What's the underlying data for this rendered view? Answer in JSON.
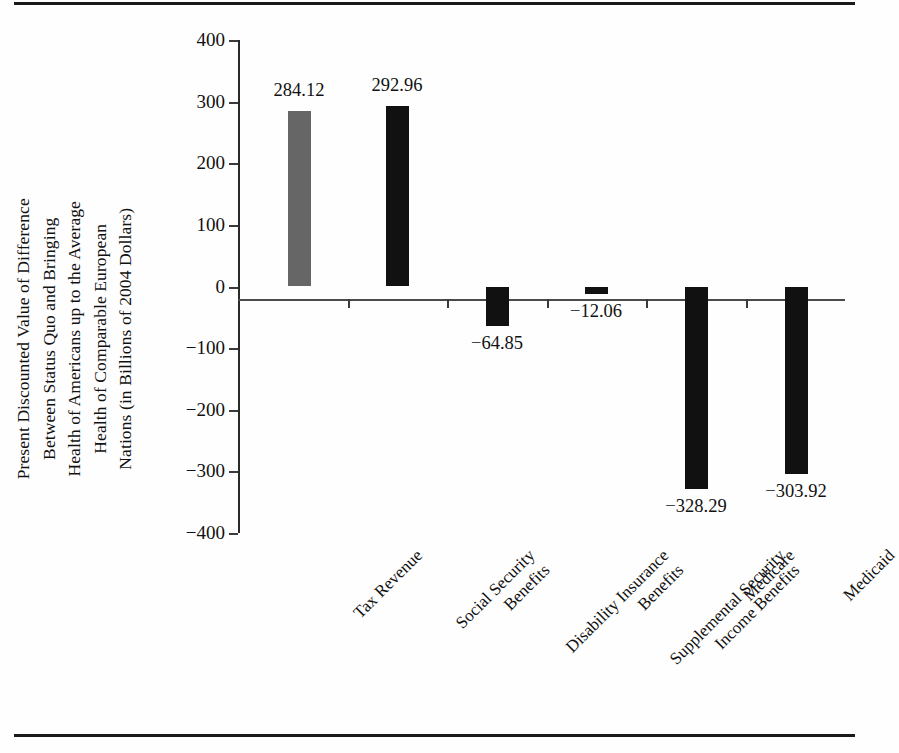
{
  "figure": {
    "has_top_rule": true,
    "has_bottom_rule": true
  },
  "axis": {
    "y_title_lines": [
      "Present Discounted Value of Difference",
      "Between Status Quo and Bringing",
      "Health of Americans up to the Average",
      "Health of Comparable European",
      "Nations (in Billions of 2004 Dollars)"
    ],
    "y_ticks": [
      "400",
      "300",
      "200",
      "100",
      "0",
      "−100",
      "−200",
      "−300",
      "−400"
    ]
  },
  "chart_data": {
    "type": "bar",
    "title": "",
    "xlabel": "",
    "ylabel": "Present Discounted Value of Difference Between Status Quo and Bringing Health of Americans up to the Average Health of Comparable European Nations (in Billions of 2004 Dollars)",
    "ylim": [
      -400,
      400
    ],
    "ytick_step": 100,
    "grid": false,
    "legend": "none",
    "categories": [
      "Tax Revenue",
      "Social Security Benefits",
      "Disability Insurance Benefits",
      "Supplemental Security Income Benefits",
      "Medicare",
      "Medicaid"
    ],
    "category_lines": [
      [
        "Tax Revenue"
      ],
      [
        "Social Security",
        "Benefits"
      ],
      [
        "Disability Insurance",
        "Benefits"
      ],
      [
        "Supplemental Security",
        "Income Benefits"
      ],
      [
        "Medicare"
      ],
      [
        "Medicaid"
      ]
    ],
    "values": [
      284.12,
      292.96,
      -64.85,
      -12.06,
      -328.29,
      -303.92
    ],
    "value_labels": [
      "284.12",
      "292.96",
      "−64.85",
      "−12.06",
      "−328.29",
      "−303.92"
    ],
    "bar_colors": [
      "#666666",
      "#111111",
      "#111111",
      "#111111",
      "#111111",
      "#111111"
    ]
  },
  "colors": {
    "bar_gray": "#666666",
    "bar_black": "#111111",
    "axis": "#2a2a2a",
    "rule": "#1a1a1a",
    "background": "#fefefe"
  }
}
